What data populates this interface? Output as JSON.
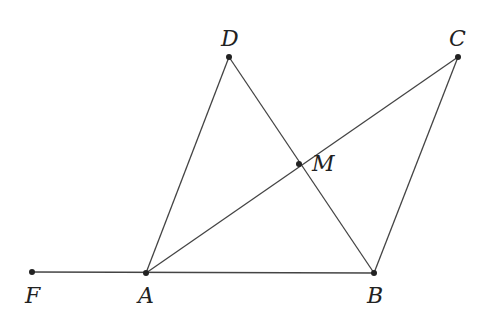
{
  "diagram": {
    "type": "geometry",
    "stroke_color": "#444444",
    "point_color": "#222222",
    "points": [
      {
        "id": "D",
        "label": "D",
        "x": 229,
        "y": 57,
        "lx": 221,
        "ly": 28
      },
      {
        "id": "C",
        "label": "C",
        "x": 458,
        "y": 57,
        "lx": 449,
        "ly": 28
      },
      {
        "id": "M",
        "label": "M",
        "x": 299,
        "y": 164,
        "lx": 312,
        "ly": 153
      },
      {
        "id": "F",
        "label": "F",
        "x": 32,
        "y": 272,
        "lx": 25,
        "ly": 285
      },
      {
        "id": "A",
        "label": "A",
        "x": 146,
        "y": 273,
        "lx": 138,
        "ly": 285
      },
      {
        "id": "B",
        "label": "B",
        "x": 374,
        "y": 273,
        "lx": 367,
        "ly": 285
      }
    ],
    "segments": [
      {
        "from": "F",
        "to": "B"
      },
      {
        "from": "A",
        "to": "D"
      },
      {
        "from": "D",
        "to": "B"
      },
      {
        "from": "A",
        "to": "C"
      },
      {
        "from": "C",
        "to": "B"
      }
    ]
  }
}
